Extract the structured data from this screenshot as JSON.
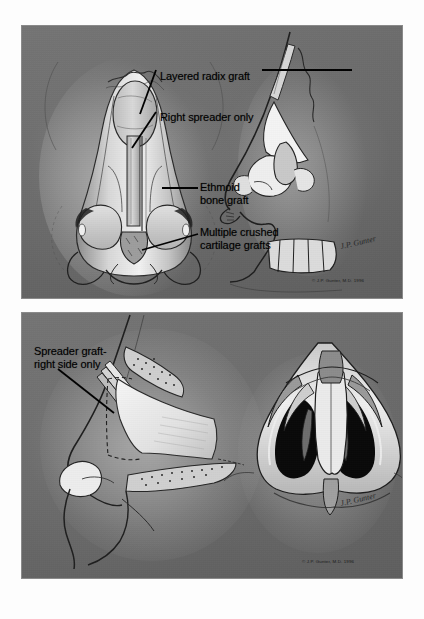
{
  "figure": {
    "background_color": "#ffffff",
    "panel_color": "#6c6c6c",
    "ink_color": "#1a1a1a",
    "panels": [
      {
        "id": "panel-top",
        "name": "upper-figure-panel",
        "copyright": "© J.P. Gunter, M.D. 1996",
        "signature": "J.P. Gunter",
        "views": [
          {
            "name": "frontal-nose-view",
            "position": "left"
          },
          {
            "name": "lateral-profile-view",
            "position": "right"
          }
        ],
        "labels": [
          {
            "id": "layered-radix-graft",
            "text": "Layered radix graft",
            "x": 138,
            "y": 44
          },
          {
            "id": "right-spreader-only",
            "text": "Right spreader only",
            "x": 138,
            "y": 85
          },
          {
            "id": "ethmoid-bone-graft",
            "text": "Ethmoid\nbone graft",
            "x": 178,
            "y": 158
          },
          {
            "id": "multiple-crushed-grafts",
            "text": "Multiple crushed\ncartilage grafts",
            "x": 178,
            "y": 202
          }
        ]
      },
      {
        "id": "panel-bottom",
        "name": "lower-figure-panel",
        "copyright": "© J.P. Gunter, M.D. 1996",
        "signature": "J.P. Gunter",
        "views": [
          {
            "name": "oblique-septum-view",
            "position": "left"
          },
          {
            "name": "base-nose-view",
            "position": "right"
          }
        ],
        "labels": [
          {
            "id": "spreader-graft-right-side-only",
            "text": "Spreader graft-\nright side only",
            "x": 12,
            "y": 38
          }
        ]
      }
    ]
  }
}
